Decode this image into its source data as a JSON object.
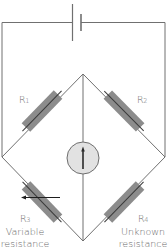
{
  "colors": {
    "wire": "#707070",
    "resistor_body": "#8c8c8c",
    "resistor_core": "#3a3a3a",
    "galvanometer_fill": "#e2e2e2",
    "galvanometer_stroke": "#6e6e6e",
    "needle": "#2a2a2a",
    "label_text": "#6a6a6a"
  },
  "components": {
    "battery": {
      "name": "cell",
      "position": "top wire"
    },
    "galvanometer": {
      "name": "galvanometer",
      "position": "center bridge"
    },
    "resistors": [
      {
        "id": "R1",
        "letter": "R",
        "subscript": "1",
        "description": "",
        "arm": "top-left"
      },
      {
        "id": "R2",
        "letter": "R",
        "subscript": "2",
        "description": "",
        "arm": "top-right"
      },
      {
        "id": "R3",
        "letter": "R",
        "subscript": "3",
        "description_line1": "Variable",
        "description_line2": "resistance",
        "arm": "bottom-left",
        "variable": true
      },
      {
        "id": "R4",
        "letter": "R",
        "subscript": "4",
        "description_line1": "Unknown",
        "description_line2": "resistance",
        "arm": "bottom-right"
      }
    ]
  }
}
